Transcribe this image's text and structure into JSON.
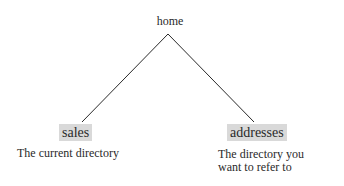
{
  "diagram": {
    "root": {
      "label": "home"
    },
    "children": [
      {
        "label": "sales",
        "caption": "The current directory"
      },
      {
        "label": "addresses",
        "caption_lines": [
          "The directory you",
          "want to refer to"
        ]
      }
    ],
    "colors": {
      "line": "#2a2a2a",
      "highlight": "#d9d9d9",
      "text": "#2a2a2a"
    }
  }
}
